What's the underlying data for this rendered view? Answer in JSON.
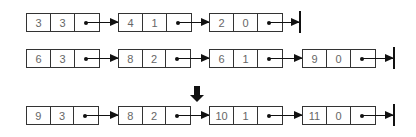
{
  "lists": [
    {
      "name": "list-a",
      "nodes": [
        {
          "coef": "3",
          "exp": "3"
        },
        {
          "coef": "4",
          "exp": "1"
        },
        {
          "coef": "2",
          "exp": "0"
        }
      ]
    },
    {
      "name": "list-b",
      "nodes": [
        {
          "coef": "6",
          "exp": "3"
        },
        {
          "coef": "8",
          "exp": "2"
        },
        {
          "coef": "6",
          "exp": "1"
        },
        {
          "coef": "9",
          "exp": "0"
        }
      ]
    },
    {
      "name": "list-result",
      "nodes": [
        {
          "coef": "9",
          "exp": "3"
        },
        {
          "coef": "8",
          "exp": "2"
        },
        {
          "coef": "10",
          "exp": "1"
        },
        {
          "coef": "11",
          "exp": "0"
        }
      ]
    }
  ],
  "icons": {
    "pointer": "dot-arrow",
    "null_terminator": "vertical-bar",
    "result_indicator": "down-arrow"
  }
}
